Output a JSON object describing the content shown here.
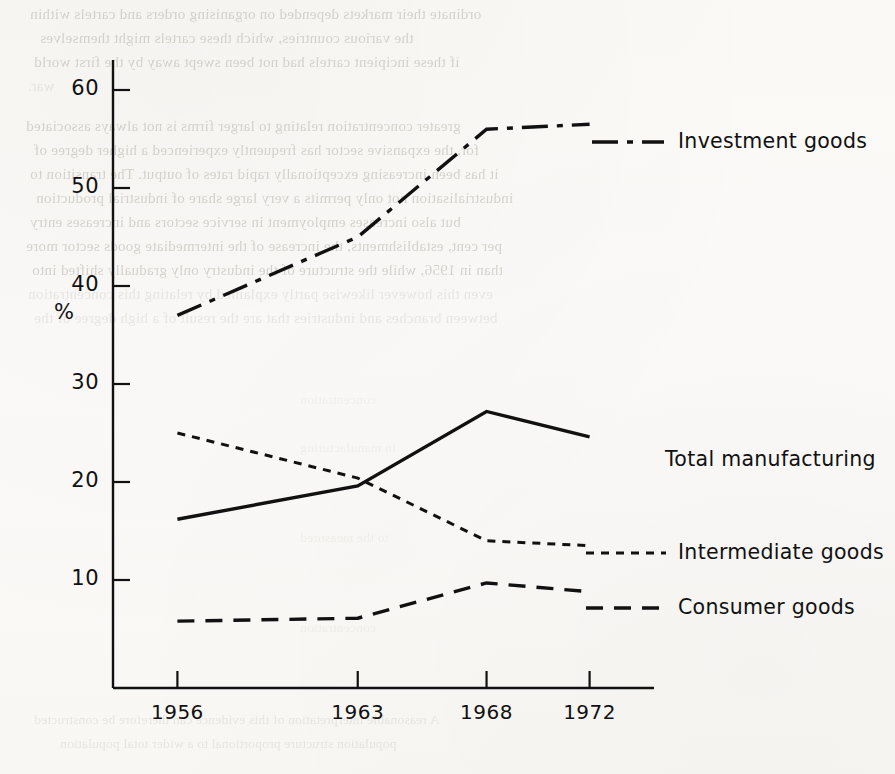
{
  "page": {
    "background_color": "#fbfaf8",
    "ink_color": "#111111"
  },
  "ghost_text": {
    "note": "faint bleed-through text from reverse of scanned page",
    "lines": [
      "ordinate their markets depended on organising orders and cartels within",
      "the various countries, which these cartels might themselves",
      "if these incipient cartels had not been swept away by the first world",
      "war.",
      "greater concentration relating to larger firms is not always associated",
      "for, the expansive sector has frequently experienced a higher degree of",
      "it has been increasing exceptionally rapid rates of output. The transition to",
      "industrialisation not only permits a very large share of industrial production",
      "but also increases employment in service sectors and increases entry",
      "per cent, establishments, the increase of the intermediate goods sector more",
      "than in 1956, while the structure of the industry only gradually shifted into",
      "even this however likewise partly explained by relating this concentration",
      "between branches and industries that are the result of a high degree of the",
      "concentration",
      "in manufacturing",
      "to the measured",
      "concentration",
      "A reasonable interpretation of this evidence can therefore be constructed",
      "population structure proportional to a wider total population"
    ]
  },
  "chart_data": {
    "type": "line",
    "title": "",
    "xlabel": "",
    "ylabel": "%",
    "categories": [
      "1956",
      "1963",
      "1968",
      "1972"
    ],
    "x_values": [
      1956,
      1963,
      1968,
      1972
    ],
    "ylim": [
      0,
      63
    ],
    "xlim": [
      1953.5,
      1974.5
    ],
    "y_ticks": [
      10,
      20,
      30,
      40,
      50,
      60
    ],
    "x_ticks": [
      "1956",
      "1963",
      "1968",
      "1972"
    ],
    "grid": false,
    "legend_position": "right-inline-labels",
    "series": [
      {
        "name": "Investment goods",
        "values": [
          37.0,
          45.0,
          56.0,
          56.5
        ],
        "linestyle": "dash-dot",
        "color": "#111111"
      },
      {
        "name": "Total manufacturing",
        "values": [
          16.2,
          19.6,
          27.2,
          24.6
        ],
        "linestyle": "solid",
        "color": "#111111"
      },
      {
        "name": "Intermediate goods",
        "values": [
          25.0,
          20.4,
          14.0,
          13.5
        ],
        "linestyle": "dotted",
        "color": "#111111"
      },
      {
        "name": "Consumer goods",
        "values": [
          5.8,
          6.1,
          9.7,
          8.8
        ],
        "linestyle": "dashed",
        "color": "#111111"
      }
    ]
  },
  "axis": {
    "y_label": "%",
    "y_tick_labels": [
      "60",
      "50",
      "40",
      "30",
      "20",
      "10"
    ],
    "x_tick_labels": [
      "1956",
      "1963",
      "1968",
      "1972"
    ]
  },
  "series_labels": [
    {
      "key": "investment",
      "text": "Investment goods"
    },
    {
      "key": "total",
      "text": "Total manufacturing"
    },
    {
      "key": "intermediate",
      "text": "Intermediate goods"
    },
    {
      "key": "consumer",
      "text": "Consumer goods"
    }
  ]
}
